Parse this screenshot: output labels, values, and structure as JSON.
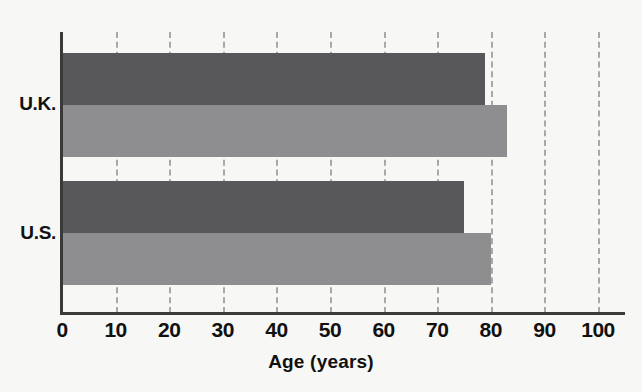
{
  "chart_data": {
    "type": "bar",
    "orientation": "horizontal",
    "title": "",
    "xlabel": "Age (years)",
    "ylabel": "",
    "categories": [
      "U.K.",
      "U.S."
    ],
    "series": [
      {
        "name": "series-dark",
        "color": "#58585a",
        "values": [
          79,
          75
        ]
      },
      {
        "name": "series-light",
        "color": "#8e8e90",
        "values": [
          83,
          80
        ]
      }
    ],
    "xlim": [
      0,
      100
    ],
    "xticks": [
      0,
      10,
      20,
      30,
      40,
      50,
      60,
      70,
      80,
      90,
      100
    ],
    "xtick_labels": [
      "0",
      "10",
      "20",
      "30",
      "40",
      "50",
      "60",
      "70",
      "80",
      "90",
      "100"
    ],
    "grid": true,
    "grid_axis": "x",
    "grid_style": "dashed",
    "grid_color": "#a8a8a8",
    "legend": null,
    "background": "#f7f7f5",
    "axis_color": "#3a3a3a",
    "text_color": "#111111"
  }
}
